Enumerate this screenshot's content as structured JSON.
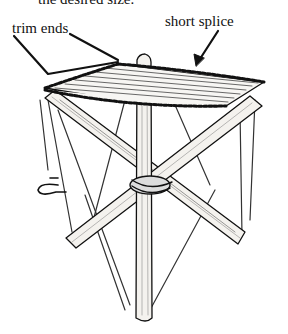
{
  "figure": {
    "caption_fragment": "the desired size.",
    "labels": {
      "trim_ends": "trim ends",
      "short_splice": "short  splice"
    }
  },
  "colors": {
    "ink": "#111111",
    "background": "#ffffff",
    "wood_fill": "#f4f2ee"
  }
}
